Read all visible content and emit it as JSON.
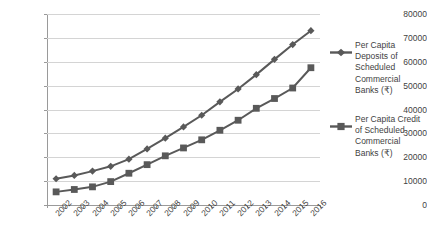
{
  "chart_data": {
    "type": "line",
    "title": "",
    "xlabel": "",
    "ylabel": "",
    "ylim": [
      0,
      80000
    ],
    "ytick_labels": [
      "80000",
      "70000",
      "60000",
      "50000",
      "40000",
      "30000",
      "20000",
      "10000",
      "0"
    ],
    "ytick_values": [
      80000,
      70000,
      60000,
      50000,
      40000,
      30000,
      20000,
      10000,
      0
    ],
    "grid": true,
    "legend_position": "right",
    "categories": [
      "2002",
      "2003",
      "2004",
      "2005",
      "2006",
      "2007",
      "2008",
      "2009",
      "2010",
      "2011",
      "2012",
      "2013",
      "2014",
      "2015",
      "2016"
    ],
    "series": [
      {
        "name": "Per Capita Deposits of Scheduled Commercial Banks (₹)",
        "marker": "diamond",
        "color": "#595959",
        "values": [
          11000,
          12400,
          14200,
          16200,
          19200,
          23500,
          28000,
          32700,
          37600,
          43200,
          48600,
          54600,
          61000,
          67200,
          73000
        ]
      },
      {
        "name": "Per Capita Credit of Scheduled Commercial Banks (₹)",
        "marker": "square",
        "color": "#595959",
        "values": [
          5500,
          6500,
          7600,
          9800,
          13300,
          16900,
          20600,
          23900,
          27300,
          31300,
          35500,
          40500,
          44600,
          49000,
          57500
        ]
      }
    ]
  },
  "legend": {
    "entries": [
      {
        "label": "Per Capita Deposits of Scheduled Commercial Banks (₹)",
        "marker": "diamond-marker"
      },
      {
        "label": "Per Capita Credit of Scheduled Commercial Banks (₹)",
        "marker": "square-marker"
      }
    ]
  },
  "colors": {
    "line": "#595959",
    "grid": "#d4d4d4",
    "axis": "#9a9a9a",
    "text": "#3f3f3f"
  }
}
